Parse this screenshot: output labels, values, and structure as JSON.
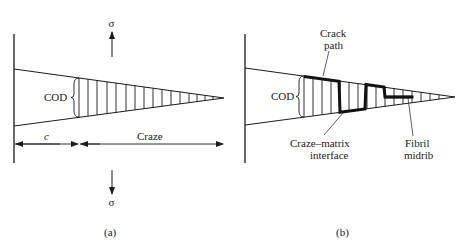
{
  "panel_a": {
    "caption": "(a)",
    "stress_top": "σ",
    "stress_bottom": "σ",
    "cod_label": "COD",
    "crack_length_label": "c",
    "craze_label": "Craze"
  },
  "panel_b": {
    "caption": "(b)",
    "cod_label": "COD",
    "crack_path_line1": "Crack",
    "crack_path_line2": "path",
    "interface_line1": "Craze–matrix",
    "interface_line2": "interface",
    "midrib_line1": "Fibril",
    "midrib_line2": "midrib"
  },
  "colors": {
    "ink": "#1a1a1a",
    "background": "#ffffff"
  }
}
